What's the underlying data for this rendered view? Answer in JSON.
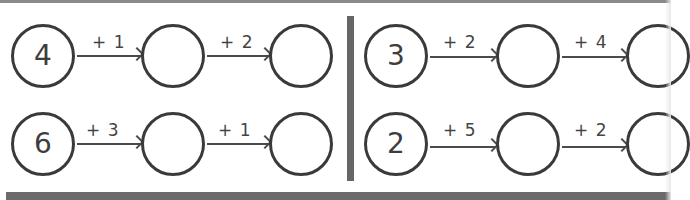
{
  "worksheet": {
    "title": "Addition number chains",
    "panels": [
      {
        "name": "left",
        "chains": [
          {
            "start": "4",
            "steps": [
              "+ 1",
              "+ 2"
            ],
            "answers": [
              "",
              ""
            ]
          },
          {
            "start": "6",
            "steps": [
              "+ 3",
              "+ 1"
            ],
            "answers": [
              "",
              ""
            ]
          }
        ]
      },
      {
        "name": "right",
        "chains": [
          {
            "start": "3",
            "steps": [
              "+ 2",
              "+ 4"
            ],
            "answers": [
              "",
              ""
            ]
          },
          {
            "start": "2",
            "steps": [
              "+ 5",
              "+ 2"
            ],
            "answers": [
              "",
              ""
            ]
          }
        ]
      }
    ]
  },
  "colors": {
    "stroke": "#3a3a3a",
    "divider": "#666666",
    "bottom_bar": "#6b6b6b",
    "background": "#ffffff"
  }
}
